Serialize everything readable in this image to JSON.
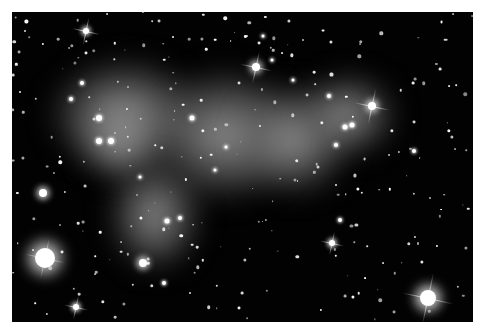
{
  "image": {
    "subject": "galaxy cluster with diffuse glow",
    "background_color": "#020202",
    "frame_color": "#ffffff",
    "frame": {
      "x": 12,
      "y": 12,
      "w": 461,
      "h": 310
    }
  },
  "glows": [
    {
      "x": 50,
      "y": 60,
      "w": 150,
      "h": 110
    },
    {
      "x": 150,
      "y": 70,
      "w": 150,
      "h": 130
    },
    {
      "x": 240,
      "y": 85,
      "w": 110,
      "h": 110
    },
    {
      "x": 300,
      "y": 75,
      "w": 95,
      "h": 80
    },
    {
      "x": 110,
      "y": 160,
      "w": 90,
      "h": 110
    },
    {
      "x": 80,
      "y": 100,
      "w": 80,
      "h": 80
    }
  ],
  "bright_stars": [
    {
      "x": 86,
      "y": 31,
      "r": 3,
      "spikes": 14
    },
    {
      "x": 256,
      "y": 67,
      "r": 4,
      "spikes": 16
    },
    {
      "x": 372,
      "y": 106,
      "r": 4,
      "spikes": 18
    },
    {
      "x": 45,
      "y": 258,
      "r": 10,
      "spikes": 20
    },
    {
      "x": 332,
      "y": 243,
      "r": 3,
      "spikes": 12
    },
    {
      "x": 428,
      "y": 298,
      "r": 8,
      "spikes": 26
    },
    {
      "x": 76,
      "y": 307,
      "r": 3,
      "spikes": 12
    },
    {
      "x": 43,
      "y": 193,
      "r": 4,
      "spikes": 0
    },
    {
      "x": 143,
      "y": 263,
      "r": 4,
      "spikes": 0
    }
  ],
  "galaxies": [
    {
      "x": 99,
      "y": 118,
      "r": 3
    },
    {
      "x": 99,
      "y": 141,
      "r": 3
    },
    {
      "x": 111,
      "y": 141,
      "r": 3
    },
    {
      "x": 192,
      "y": 118,
      "r": 2.5
    },
    {
      "x": 82,
      "y": 83,
      "r": 2
    },
    {
      "x": 71,
      "y": 99,
      "r": 2
    },
    {
      "x": 167,
      "y": 221,
      "r": 2.5
    },
    {
      "x": 180,
      "y": 218,
      "r": 2
    },
    {
      "x": 345,
      "y": 127,
      "r": 2.5
    },
    {
      "x": 352,
      "y": 125,
      "r": 2.5
    },
    {
      "x": 336,
      "y": 145,
      "r": 2
    },
    {
      "x": 164,
      "y": 283,
      "r": 2
    },
    {
      "x": 414,
      "y": 151,
      "r": 2
    },
    {
      "x": 340,
      "y": 220,
      "r": 2
    },
    {
      "x": 329,
      "y": 96,
      "r": 2
    },
    {
      "x": 226,
      "y": 147,
      "r": 1.5
    },
    {
      "x": 215,
      "y": 170,
      "r": 1.5
    },
    {
      "x": 140,
      "y": 177,
      "r": 1.5
    },
    {
      "x": 263,
      "y": 36,
      "r": 1.5
    },
    {
      "x": 272,
      "y": 60,
      "r": 1.5
    },
    {
      "x": 293,
      "y": 80,
      "r": 1.5
    }
  ],
  "faint_star_seed": 7,
  "faint_star_count": 260
}
